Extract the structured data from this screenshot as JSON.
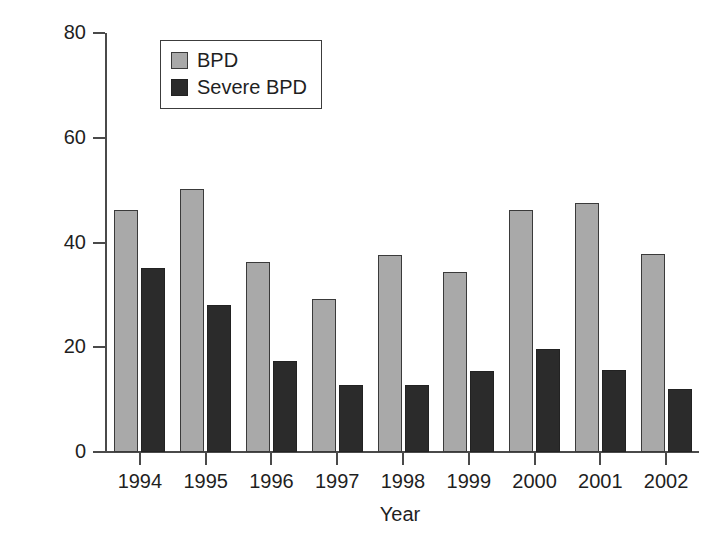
{
  "chart_data": {
    "type": "bar",
    "title": "",
    "xlabel": "Year",
    "ylabel": "Incidence (%)",
    "categories": [
      "1994",
      "1995",
      "1996",
      "1997",
      "1998",
      "1999",
      "2000",
      "2001",
      "2002"
    ],
    "series": [
      {
        "name": "BPD",
        "color": "#a9a9a9",
        "values": [
          46.2,
          50.2,
          36.3,
          29.3,
          37.6,
          34.4,
          46.2,
          47.5,
          37.8
        ]
      },
      {
        "name": "Severe BPD",
        "color": "#2b2b2b",
        "values": [
          35.2,
          28.0,
          17.4,
          12.8,
          12.8,
          15.5,
          19.6,
          15.6,
          12.0
        ]
      }
    ],
    "ylim": [
      0,
      80
    ],
    "yticks": [
      0,
      20,
      40,
      60,
      80
    ],
    "ytick_labels": [
      "0",
      "20",
      "40",
      "60",
      "80"
    ],
    "grid": false,
    "legend_position": "top-left",
    "legend_entries": [
      "BPD",
      "Severe BPD"
    ]
  }
}
